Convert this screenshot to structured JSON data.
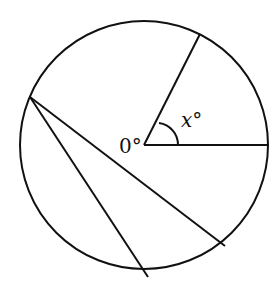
{
  "diagram": {
    "type": "circle-geometry",
    "circle": {
      "cx": 144,
      "cy": 145,
      "r": 124
    },
    "center_label": "0°",
    "angle_label": "x°",
    "radii": [
      {
        "name": "radius-horizontal",
        "to": [
          269,
          145
        ]
      },
      {
        "name": "radius-upper",
        "to": [
          200,
          34
        ]
      }
    ],
    "chords": [
      {
        "name": "chord-long",
        "from": [
          30,
          97
        ],
        "to": [
          225,
          246
        ]
      },
      {
        "name": "chord-short",
        "from": [
          30,
          97
        ],
        "to": [
          148,
          277
        ]
      }
    ],
    "stroke_color": "#111111"
  }
}
